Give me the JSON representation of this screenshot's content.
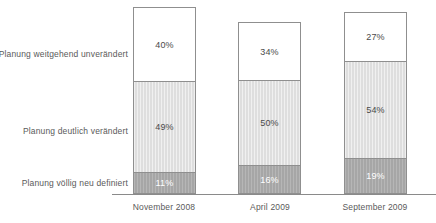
{
  "chart_data": {
    "type": "bar",
    "subtype": "stacked-bar-100",
    "title": "",
    "subtitle": "",
    "xlabel": "",
    "ylabel": "",
    "grid": false,
    "legend_position": "left-axis-labels",
    "ylim": [
      0,
      100
    ],
    "value_suffix": "%",
    "categories": [
      "November 2008",
      "April 2009",
      "September 2009"
    ],
    "series": [
      {
        "name": "Planung völlig neu definiert",
        "values": [
          11,
          16,
          19
        ],
        "labels": [
          "11%",
          "16%",
          "19%"
        ],
        "color": "#a6a6a6",
        "text_color": "#ffffff"
      },
      {
        "name": "Planung deutlich verändert",
        "values": [
          49,
          50,
          54
        ],
        "labels": [
          "49%",
          "50%",
          "54%"
        ],
        "color": "#dedede",
        "text_color": "#4a4a4a"
      },
      {
        "name": "Planung weitgehend unverändert",
        "values": [
          40,
          34,
          27
        ],
        "labels": [
          "40%",
          "34%",
          "27%"
        ],
        "color": "#ffffff",
        "text_color": "#4a4a4a"
      }
    ]
  },
  "category_labels": {
    "top": "Planung weitgehend unverändert",
    "middle": "Planung deutlich verändert",
    "bottom": "Planung völlig neu definiert"
  },
  "axis": {
    "ticks": [
      "November 2008",
      "April 2009",
      "September 2009"
    ],
    "line_color": "#8a8a8a"
  },
  "bars": [
    {
      "category": "November 2008",
      "segments": {
        "top": "40%",
        "middle": "49%",
        "bottom": "11%"
      }
    },
    {
      "category": "April 2009",
      "segments": {
        "top": "34%",
        "middle": "50%",
        "bottom": "16%"
      }
    },
    {
      "category": "September 2009",
      "segments": {
        "top": "27%",
        "middle": "54%",
        "bottom": "19%"
      }
    }
  ],
  "colors": {
    "segment_top": "#ffffff",
    "segment_middle": "#dedede",
    "segment_bottom": "#a6a6a6",
    "border": "#8f8f8f",
    "text": "#5a5a5a",
    "background": "#ffffff"
  }
}
